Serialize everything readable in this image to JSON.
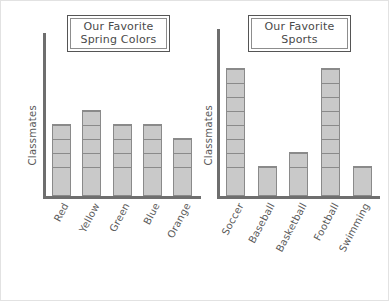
{
  "page": {
    "background": "#ffffff",
    "border_color": "#e2e2e2"
  },
  "style": {
    "bar_fill": "#c9c9c9",
    "bar_border": "#8a8a8a",
    "axis_color": "#6e6e6e",
    "text_color": "#5a5a5a",
    "title_border_outer": "#555555",
    "title_border_inner": "#8d8d8d"
  },
  "charts": [
    {
      "id": "favorite-spring-colors",
      "title_line1": "Our Favorite",
      "title_line2": "Spring Colors",
      "ylabel": "Classmates",
      "categories": [
        "Red",
        "Yellow",
        "Green",
        "Blue",
        "Orange"
      ],
      "values": [
        5,
        6,
        5,
        5,
        4
      ]
    },
    {
      "id": "favorite-sports",
      "title_line1": "Our Favorite",
      "title_line2": "Sports",
      "ylabel": "Classmates",
      "categories": [
        "Soccer",
        "Baseball",
        "Basketball",
        "Football",
        "Swimming"
      ],
      "values": [
        9,
        2,
        3,
        9,
        2
      ]
    }
  ],
  "chart_data": [
    {
      "type": "bar",
      "title": "Our Favorite Spring Colors",
      "xlabel": "",
      "ylabel": "Classmates",
      "categories": [
        "Red",
        "Yellow",
        "Green",
        "Blue",
        "Orange"
      ],
      "values": [
        5,
        6,
        5,
        5,
        4
      ],
      "ylim": [
        0,
        11
      ],
      "grid": false,
      "legend": "none",
      "notes": "Stacked unit-square pictograph style bars; each square equals 1 classmate."
    },
    {
      "type": "bar",
      "title": "Our Favorite Sports",
      "xlabel": "",
      "ylabel": "Classmates",
      "categories": [
        "Soccer",
        "Baseball",
        "Basketball",
        "Football",
        "Swimming"
      ],
      "values": [
        9,
        2,
        3,
        9,
        2
      ],
      "ylim": [
        0,
        11
      ],
      "grid": false,
      "legend": "none",
      "notes": "Stacked unit-square pictograph style bars; each square equals 1 classmate."
    }
  ]
}
